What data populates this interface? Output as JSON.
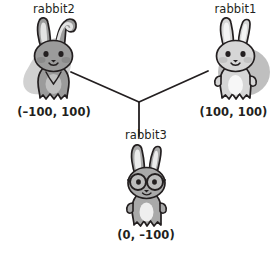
{
  "diagram": {
    "background_color": "#ffffff",
    "text_color": "#231f20",
    "line_color": "#231f20",
    "junction": {
      "x": 139,
      "y": 102
    },
    "nodes": [
      {
        "id": "rabbit2",
        "name": "rabbit2",
        "coordinates": "(–100, 100)",
        "x": -100,
        "y": 100,
        "body_color": "#9b9b9b",
        "belly_color": "#b9b9b9",
        "shadow_color": "#c9c9c9",
        "shadow_shape": "diagonal-blob",
        "ear_style": "one-bent",
        "accessory": "none"
      },
      {
        "id": "rabbit1",
        "name": "rabbit1",
        "coordinates": "(100, 100)",
        "x": 100,
        "y": 100,
        "body_color": "#d6d6d6",
        "belly_color": "#f2f2f2",
        "shadow_color": "#b8b8b8",
        "shadow_shape": "round-blob",
        "ear_style": "straight",
        "accessory": "none"
      },
      {
        "id": "rabbit3",
        "name": "rabbit3",
        "coordinates": "(0, –100)",
        "x": 0,
        "y": -100,
        "body_color": "#a9a9a9",
        "belly_color": "#ededed",
        "shadow_color": "#cccccc",
        "shadow_shape": "none",
        "ear_style": "straight",
        "accessory": "glasses"
      }
    ],
    "edges": [
      {
        "from": "junction",
        "to": "rabbit2"
      },
      {
        "from": "junction",
        "to": "rabbit1"
      },
      {
        "from": "junction",
        "to": "rabbit3"
      }
    ]
  }
}
